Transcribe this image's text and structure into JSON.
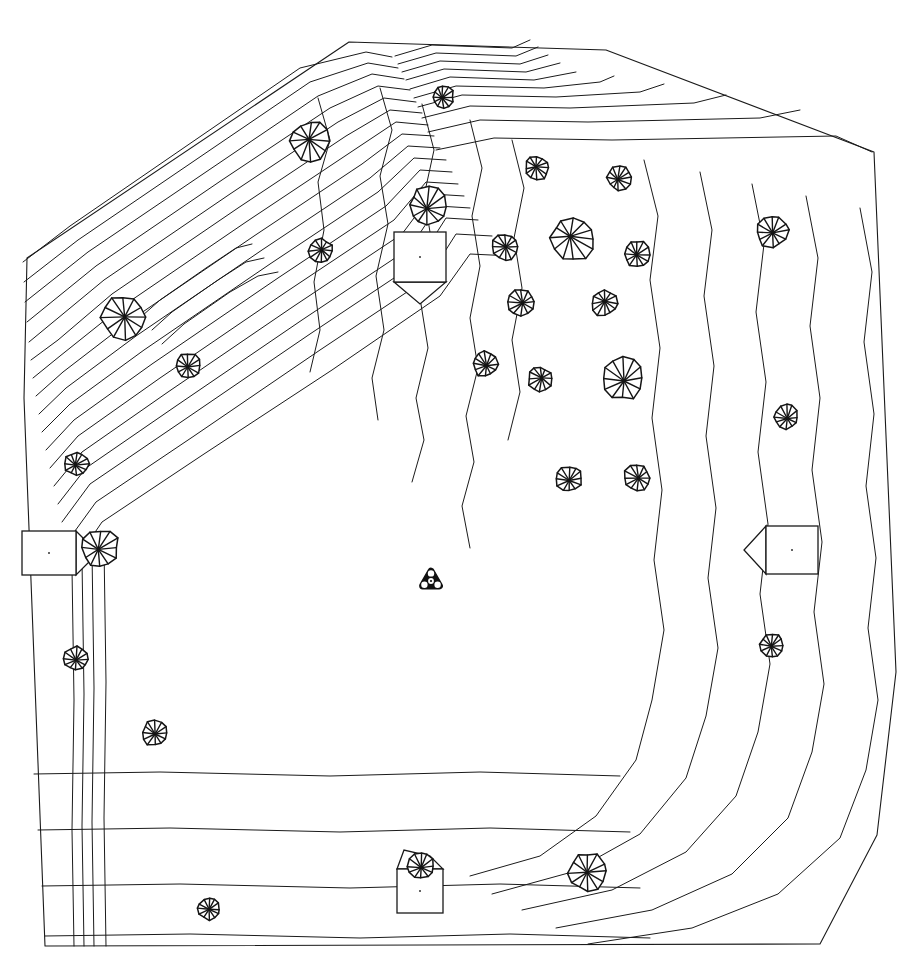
{
  "document": {
    "kind": "site-plan",
    "title": "Topographic Site Plan",
    "description": "Black-and-white CAD line drawing of an irregular pentagonal land parcel with topographic contour lines, tree symbols and small building footprints.",
    "background_color": "#ffffff",
    "line_color": "#1a1a1a",
    "width": 913,
    "height": 967
  },
  "legend": {
    "tree_symbol_name": "tree-canopy-icon",
    "building_symbol_name": "building-footprint-icon",
    "benchmark_symbol_name": "survey-benchmark-icon",
    "contour_symbol_name": "contour-line"
  },
  "boundary": {
    "name": "site-boundary",
    "points": "27,258 349,42 606,50 874,152 896,672 877,835 820,944 45,946 24,398"
  },
  "contours": {
    "dense_slope_nw": {
      "label": "northwest-steep-slope",
      "count": 17,
      "paths": [
        "M23,262 L70,226 L300,68 L366,52 L392,57",
        "M24,282 L78,240 L310,82 L368,63 L398,68",
        "M25,302 L88,252 L318,96 L372,74 L404,79",
        "M27,322 L96,266 L222,180 L330,108 L378,86 L410,90",
        "M29,342 L104,280 L230,194 L338,122 L384,98 L416,102",
        "M31,360 L58,340 L112,294 L238,208 L346,136 L390,110 L422,113",
        "M33,378 L60,356 L120,308 L246,222 L354,150 L396,122 L428,125",
        "M36,396 L63,372 L128,322 L254,236 L362,164 L402,134 L434,136",
        "M39,414 L66,388 L136,336 L262,250 L370,178 L408,146 L440,148",
        "M42,432 L70,404 L144,350 L270,264 L378,192 L414,158 L446,160",
        "M46,450 L74,420 L152,364 L278,278 L386,206 L420,170 L452,172",
        "M50,468 L78,436 L160,378 L286,292 L394,220 L426,182 L458,184",
        "M54,486 L82,452 L168,392 L294,306 L402,234 L432,194 L464,196",
        "M58,504 L86,468 L176,406 L302,320 L410,248 L438,206 L470,208",
        "M62,522 L90,484 L184,420 L310,334 L418,262 L446,218 L478,220",
        "M67,542 L96,502 L194,436 L320,350 L428,278 L456,234 L492,236",
        "M72,566 L102,522 L204,454 L332,370 L440,296 L470,254 L512,256"
      ]
    },
    "nw_inner_peaks": {
      "label": "northwest-summit-loops",
      "paths": [
        "M142,316 L160,300 L206,268 L236,248 L252,244",
        "M152,330 L172,312 L218,280 L246,262 L264,258",
        "M162,344 L184,324 L230,292 L258,276 L278,272"
      ]
    },
    "north_ridge": {
      "label": "north-ridge-bands",
      "paths": [
        "M395,56 L432,45 L512,48 L530,40",
        "M398,64 L436,53 L516,56 L538,47",
        "M402,72 L440,61 L520,64 L548,55",
        "M406,80 L444,69 L526,72 L560,63",
        "M410,89 L450,77 L534,80 L576,72",
        "M414,98 L456,86 L544,88 L600,82 L614,76",
        "M418,107 L462,95 L556,97 L640,92 L664,84",
        "M422,118 L470,106 L570,108 L694,103 L726,95",
        "M428,132 L480,120 L588,122 L760,118 L800,110",
        "M436,150 L494,138 L612,140 L836,136 L872,152"
      ]
    },
    "upper_mid_verticals": {
      "label": "north-central-contours",
      "paths": [
        "M318,98 L330,140 L318,182 L324,230 L314,282 L320,330 L310,372",
        "M380,88 L392,130 L380,176 L388,224 L376,276 L384,330 L372,378 L378,420",
        "M422,104 L434,150 L424,196 L432,244 L420,298 L428,348 L416,398 L424,440 L412,482",
        "M470,120 L482,168 L472,216 L480,266 L470,318 L478,368 L466,416 L474,462 L462,506 L470,548",
        "M512,140 L524,188 L514,238 L522,288 L512,340 L520,392 L508,440"
      ]
    },
    "east_bands": {
      "label": "east-edge-contours",
      "paths": [
        "M644,160 L658,216 L650,280 L660,348 L652,418 L662,490 L654,560 L664,630 L652,700 L636,760 L596,816 L540,856 L470,876",
        "M700,172 L712,230 L704,296 L714,366 L706,436 L716,508 L708,578 L718,648 L706,716 L686,778 L640,834 L572,872 L492,894",
        "M752,184 L764,244 L756,312 L766,382 L758,452 L768,524 L760,594 L770,664 L758,732 L736,796 L686,852 L612,890 L522,910",
        "M806,196 L818,258 L810,326 L820,398 L812,470 L822,542 L814,612 L824,684 L812,752 L788,818 L732,874 L652,910 L556,928",
        "M860,208 L872,272 L864,342 L874,414 L866,486 L876,558 L868,628 L878,700 L866,770 L840,838 L778,894 L692,928 L588,944"
      ]
    },
    "south_bands": {
      "label": "south-edge-contours",
      "paths": [
        "M34,774 L160,772 L330,776 L480,772 L620,776",
        "M38,830 L170,828 L340,832 L490,828 L630,832",
        "M42,886 L180,884 L350,888 L500,884 L640,888",
        "M45,936 L190,934 L360,938 L510,934 L650,938"
      ]
    },
    "west_edge_lines": {
      "label": "west-edge-contours",
      "paths": [
        "M72,568 L74,700 L72,830 L74,946",
        "M82,560 L84,694 L82,826 L84,946",
        "M92,552 L94,688 L92,822 L94,946",
        "M104,546 L106,682 L104,818 L106,946"
      ]
    }
  },
  "trees": [
    {
      "id": "tree-01",
      "x": 443,
      "y": 97,
      "r": 11,
      "name": "tree-north-ridge"
    },
    {
      "id": "tree-02",
      "x": 310,
      "y": 141,
      "r": 20,
      "name": "tree-nw-upper"
    },
    {
      "id": "tree-03",
      "x": 428,
      "y": 206,
      "r": 19,
      "name": "tree-near-building-n"
    },
    {
      "id": "tree-04",
      "x": 321,
      "y": 251,
      "r": 12,
      "name": "tree-nw-mid"
    },
    {
      "id": "tree-05",
      "x": 124,
      "y": 318,
      "r": 22,
      "name": "tree-slope-large"
    },
    {
      "id": "tree-06",
      "x": 188,
      "y": 366,
      "r": 13,
      "name": "tree-slope-small"
    },
    {
      "id": "tree-07",
      "x": 537,
      "y": 168,
      "r": 12,
      "name": "tree-center-n1"
    },
    {
      "id": "tree-08",
      "x": 619,
      "y": 178,
      "r": 12,
      "name": "tree-center-n2"
    },
    {
      "id": "tree-09",
      "x": 573,
      "y": 239,
      "r": 22,
      "name": "tree-center-large-1"
    },
    {
      "id": "tree-10",
      "x": 505,
      "y": 247,
      "r": 13,
      "name": "tree-center-w1"
    },
    {
      "id": "tree-11",
      "x": 637,
      "y": 254,
      "r": 13,
      "name": "tree-center-e1"
    },
    {
      "id": "tree-12",
      "x": 521,
      "y": 302,
      "r": 13,
      "name": "tree-center-w2"
    },
    {
      "id": "tree-13",
      "x": 604,
      "y": 303,
      "r": 13,
      "name": "tree-center-e2"
    },
    {
      "id": "tree-14",
      "x": 485,
      "y": 364,
      "r": 13,
      "name": "tree-center-w3"
    },
    {
      "id": "tree-15",
      "x": 540,
      "y": 379,
      "r": 12,
      "name": "tree-center-mid"
    },
    {
      "id": "tree-16",
      "x": 622,
      "y": 379,
      "r": 21,
      "name": "tree-center-large-2"
    },
    {
      "id": "tree-17",
      "x": 569,
      "y": 479,
      "r": 13,
      "name": "tree-center-s1"
    },
    {
      "id": "tree-18",
      "x": 637,
      "y": 478,
      "r": 13,
      "name": "tree-center-s2"
    },
    {
      "id": "tree-19",
      "x": 772,
      "y": 231,
      "r": 16,
      "name": "tree-east-upper"
    },
    {
      "id": "tree-20",
      "x": 786,
      "y": 417,
      "r": 12,
      "name": "tree-east-mid"
    },
    {
      "id": "tree-21",
      "x": 772,
      "y": 645,
      "r": 12,
      "name": "tree-east-lower"
    },
    {
      "id": "tree-22",
      "x": 77,
      "y": 464,
      "r": 12,
      "name": "tree-west-upper"
    },
    {
      "id": "tree-23",
      "x": 100,
      "y": 548,
      "r": 19,
      "name": "tree-west-house"
    },
    {
      "id": "tree-24",
      "x": 76,
      "y": 659,
      "r": 12,
      "name": "tree-west-lower"
    },
    {
      "id": "tree-25",
      "x": 155,
      "y": 733,
      "r": 13,
      "name": "tree-southwest"
    },
    {
      "id": "tree-26",
      "x": 209,
      "y": 909,
      "r": 11,
      "name": "tree-south-field"
    },
    {
      "id": "tree-27",
      "x": 421,
      "y": 866,
      "r": 13,
      "name": "tree-south-house"
    },
    {
      "id": "tree-28",
      "x": 588,
      "y": 872,
      "r": 19,
      "name": "tree-south-large"
    }
  ],
  "buildings": [
    {
      "id": "bldg-north",
      "name": "building-footprint-north",
      "rect": {
        "x": 394,
        "y": 232,
        "w": 52,
        "h": 50
      },
      "gable": "394,282 420,304 446,282",
      "gable_dir": "south"
    },
    {
      "id": "bldg-west",
      "name": "building-footprint-west",
      "rect": {
        "x": 22,
        "y": 531,
        "w": 54,
        "h": 44
      },
      "gable": "76,531 98,553 76,575",
      "gable_dir": "east"
    },
    {
      "id": "bldg-east",
      "name": "building-footprint-east",
      "rect": {
        "x": 766,
        "y": 526,
        "w": 52,
        "h": 48
      },
      "gable": "766,526 744,550 766,574",
      "gable_dir": "west"
    },
    {
      "id": "bldg-south",
      "name": "building-footprint-south",
      "rect": {
        "x": 397,
        "y": 869,
        "w": 46,
        "h": 44
      },
      "gable": "397,869 404,850 430,856 443,869",
      "gable_dir": "north"
    }
  ],
  "benchmark": {
    "name": "survey-benchmark",
    "x": 431,
    "y": 581,
    "size": 19,
    "label": "triangulation-station"
  }
}
